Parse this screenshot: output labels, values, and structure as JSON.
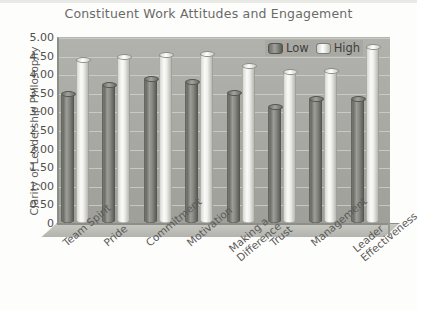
{
  "chart_data": {
    "type": "bar",
    "title": "Constituent Work Attitudes and Engagement",
    "xlabel": "",
    "ylabel": "Clarity of Leadership Philosophy",
    "ylim": [
      0,
      5
    ],
    "ytick_step": 0.5,
    "ytick_labels": [
      "5.00",
      "4.50",
      "4.00",
      "3.50",
      "3.00",
      "2.50",
      "2.00",
      "1.50",
      "1.00",
      "0.50",
      "0"
    ],
    "ytick_values": [
      5.0,
      4.5,
      4.0,
      3.5,
      3.0,
      2.5,
      2.0,
      1.5,
      1.0,
      0.5,
      0
    ],
    "grid": true,
    "legend_position": "top-right",
    "style": "3d-cylinder",
    "categories": [
      "Team Spirit",
      "Pride",
      "Commitment",
      "Motivation",
      "Making a Difference",
      "Trust",
      "Management",
      "Leader Effectiveness"
    ],
    "category_label_lines": [
      [
        "Team Spirit"
      ],
      [
        "Pride"
      ],
      [
        "Commitment"
      ],
      [
        "Motivation"
      ],
      [
        "Making a",
        "Difference"
      ],
      [
        "Trust"
      ],
      [
        "Management"
      ],
      [
        "Leader",
        "Effectiveness"
      ]
    ],
    "series": [
      {
        "name": "Low",
        "color": "#6e6e68",
        "values": [
          3.5,
          3.75,
          3.9,
          3.82,
          3.52,
          3.15,
          3.35,
          3.35
        ]
      },
      {
        "name": "High",
        "color": "#f2f2ee",
        "values": [
          4.4,
          4.5,
          4.55,
          4.57,
          4.25,
          4.08,
          4.1,
          4.75
        ]
      }
    ]
  },
  "legend": {
    "low_label": "Low",
    "high_label": "High"
  }
}
